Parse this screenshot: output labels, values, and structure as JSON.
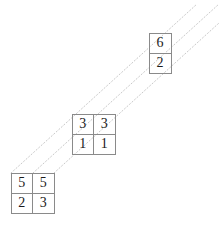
{
  "diagram": {
    "canvas": {
      "width": 219,
      "height": 229,
      "background": "#ffffff"
    },
    "style": {
      "cell_border_color": "#8a8a8a",
      "digit_color": "#1a1a1a",
      "guide_line_color": "#c9c9c9",
      "guide_line_style": "dotted"
    },
    "blocks": [
      {
        "id": "top-right",
        "name": "top-right-block",
        "columns": 1,
        "rows": 2,
        "x": 149,
        "y": 33,
        "cells": [
          {
            "row": 0,
            "col": 0,
            "value": "6"
          },
          {
            "row": 1,
            "col": 0,
            "value": "2"
          }
        ]
      },
      {
        "id": "middle",
        "name": "middle-block",
        "columns": 2,
        "rows": 2,
        "x": 72,
        "y": 114,
        "cells": [
          {
            "row": 0,
            "col": 0,
            "value": "3"
          },
          {
            "row": 0,
            "col": 1,
            "value": "3"
          },
          {
            "row": 1,
            "col": 0,
            "value": "1"
          },
          {
            "row": 1,
            "col": 1,
            "value": "1"
          }
        ]
      },
      {
        "id": "bottom-left",
        "name": "bottom-left-block",
        "columns": 2,
        "rows": 2,
        "x": 11,
        "y": 173,
        "cells": [
          {
            "row": 0,
            "col": 0,
            "value": "5"
          },
          {
            "row": 0,
            "col": 1,
            "value": "5"
          },
          {
            "row": 1,
            "col": 0,
            "value": "2"
          },
          {
            "row": 1,
            "col": 1,
            "value": "3"
          }
        ]
      }
    ],
    "guide_lines": [
      {
        "id": "guide-1",
        "name": "diagonal-guide-upper",
        "x1": 11,
        "y1": 173,
        "x2": 197,
        "y2": 4
      },
      {
        "id": "guide-2",
        "name": "diagonal-guide-middle",
        "x1": 33,
        "y1": 173,
        "x2": 219,
        "y2": 4
      },
      {
        "id": "guide-3",
        "name": "diagonal-guide-lower",
        "x1": 54,
        "y1": 173,
        "x2": 219,
        "y2": 23
      }
    ]
  }
}
